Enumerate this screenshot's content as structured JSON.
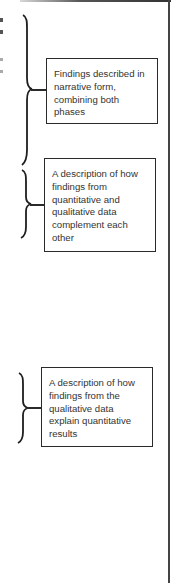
{
  "diagram": {
    "type": "annotated-bracket-callouts",
    "callouts": [
      {
        "id": "narrative",
        "text": "Findings described in narrative form, combining both phases"
      },
      {
        "id": "complement",
        "text": "A description of how findings from quantitative and qualitative data complement each other"
      },
      {
        "id": "explain",
        "text": "A description of how findings from the qualitative data explain quantitative results"
      }
    ],
    "colors": {
      "line": "#2a2a2a",
      "text": "#333333",
      "background": "#ffffff"
    }
  }
}
